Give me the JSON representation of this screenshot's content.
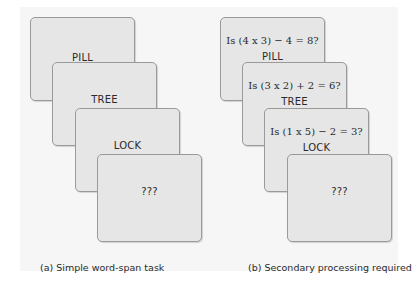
{
  "panel_a": {
    "caption": "(a) Simple word-span task",
    "cards": [
      {
        "word": "PILL"
      },
      {
        "word": "TREE"
      },
      {
        "word": "LOCK"
      },
      {
        "word": "???"
      }
    ]
  },
  "panel_b": {
    "caption": "(b) Secondary processing required",
    "cards": [
      {
        "question": "Is (4 x 3) − 4 = 8?",
        "word": "PILL"
      },
      {
        "question": "Is (3 x 2) + 2 = 6?",
        "word": "TREE"
      },
      {
        "question": "Is (1 x 5) − 2 = 3?",
        "word": "LOCK"
      },
      {
        "word": "???"
      }
    ]
  },
  "colors": {
    "background": "#f6f6f6",
    "card_fill": "#e6e6e6",
    "card_border": "#9a9a9a",
    "text": "#2a2a2a"
  }
}
